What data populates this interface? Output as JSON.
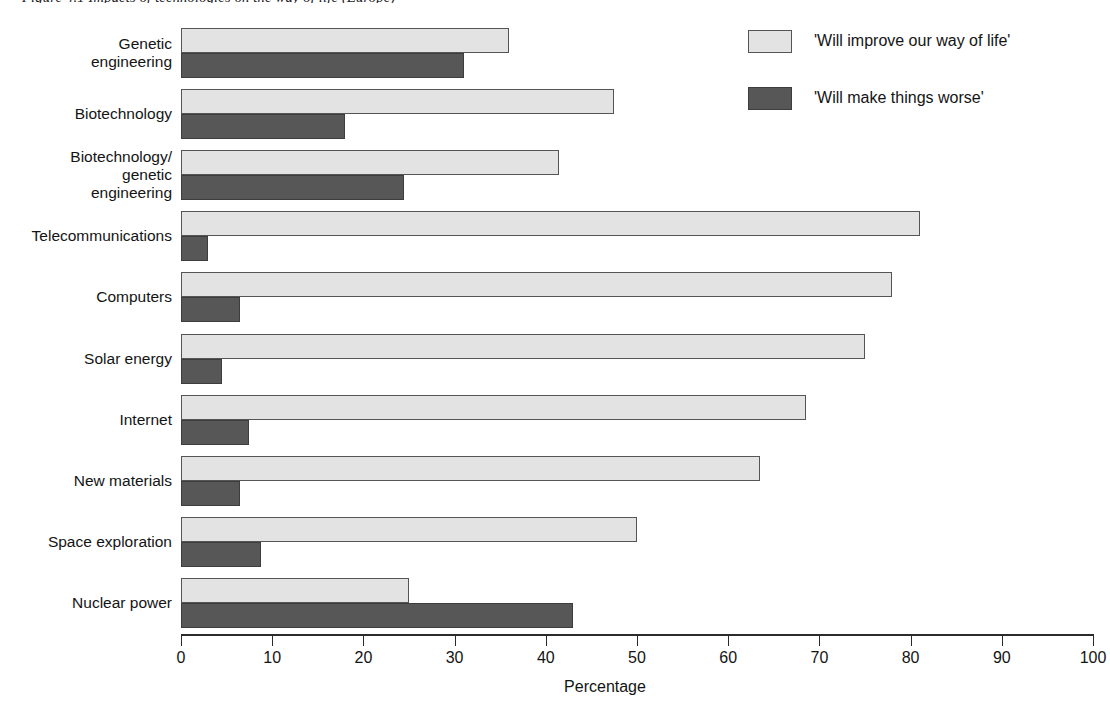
{
  "caption": {
    "text": "Figure 4.1 Impacts of technologies on the way of life (Europe)"
  },
  "legend": {
    "position": "top-right",
    "entries": [
      {
        "label": "'Will improve our way of life'",
        "color": "#e3e3e3",
        "name": "improve"
      },
      {
        "label": "'Will make things worse'",
        "color": "#575757",
        "name": "worse"
      }
    ]
  },
  "axis": {
    "x_title": "Percentage",
    "x_ticks": [
      "0",
      "10",
      "20",
      "30",
      "40",
      "50",
      "60",
      "70",
      "80",
      "90",
      "100"
    ]
  },
  "chart_data": {
    "type": "bar",
    "orientation": "horizontal",
    "title": "Figure 4.1 Impacts of technologies on the way of life (Europe)",
    "xlabel": "Percentage",
    "ylabel": "",
    "xlim": [
      0,
      100
    ],
    "xticks": [
      0,
      10,
      20,
      30,
      40,
      50,
      60,
      70,
      80,
      90,
      100
    ],
    "grid": false,
    "legend_position": "top right",
    "categories": [
      "Genetic engineering",
      "Biotechnology",
      "Biotechnology/ genetic engineering",
      "Telecommunications",
      "Computers",
      "Solar energy",
      "Internet",
      "New materials",
      "Space exploration",
      "Nuclear power"
    ],
    "category_lines": [
      [
        "Genetic",
        "engineering"
      ],
      [
        "Biotechnology"
      ],
      [
        "Biotechnology/",
        "genetic",
        "engineering"
      ],
      [
        "Telecommunications"
      ],
      [
        "Computers"
      ],
      [
        "Solar energy"
      ],
      [
        "Internet"
      ],
      [
        "New materials"
      ],
      [
        "Space exploration"
      ],
      [
        "Nuclear power"
      ]
    ],
    "series": [
      {
        "name": "'Will improve our way of life'",
        "color": "#e3e3e3",
        "values": [
          36.0,
          47.5,
          41.5,
          81.0,
          78.0,
          75.0,
          68.5,
          63.5,
          50.0,
          25.0
        ]
      },
      {
        "name": "'Will make things worse'",
        "color": "#575757",
        "values": [
          31.0,
          18.0,
          24.5,
          3.0,
          6.5,
          4.5,
          7.5,
          6.5,
          8.8,
          43.0
        ]
      }
    ]
  }
}
